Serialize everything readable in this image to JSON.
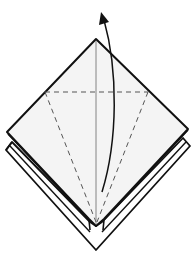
{
  "diagram": {
    "type": "origami-step",
    "colors": {
      "paper_fill": "#f4f4f4",
      "outline": "#111111",
      "dashed_fold": "#555555",
      "center_crease": "#777777",
      "arrow": "#111111",
      "background": "#ffffff"
    },
    "elements": [
      {
        "name": "back-layers",
        "kind": "outline"
      },
      {
        "name": "front-flap",
        "kind": "filled-diamond"
      },
      {
        "name": "horizontal-valley-fold",
        "kind": "dashed-line"
      },
      {
        "name": "left-diagonal-valley-fold",
        "kind": "dashed-line"
      },
      {
        "name": "right-diagonal-valley-fold",
        "kind": "dashed-line"
      },
      {
        "name": "center-crease",
        "kind": "solid-thin-line"
      },
      {
        "name": "fold-up-arrow",
        "kind": "curved-arrow"
      }
    ]
  }
}
